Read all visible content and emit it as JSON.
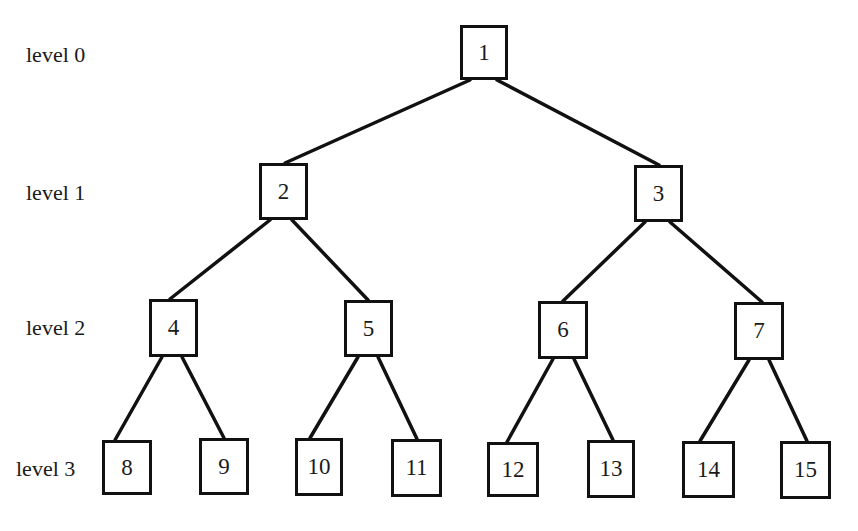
{
  "diagram": {
    "type": "complete binary tree",
    "levels": [
      {
        "label": "level 0",
        "x": 26,
        "y": 44
      },
      {
        "label": "level 1",
        "x": 26,
        "y": 182
      },
      {
        "label": "level 2",
        "x": 26,
        "y": 317
      },
      {
        "label": "level 3",
        "x": 16,
        "y": 458
      }
    ],
    "nodes": [
      {
        "id": "1",
        "label": "1",
        "x": 460,
        "y": 25,
        "w": 48,
        "h": 55
      },
      {
        "id": "2",
        "label": "2",
        "x": 259,
        "y": 163,
        "w": 49,
        "h": 57
      },
      {
        "id": "3",
        "label": "3",
        "x": 634,
        "y": 165,
        "w": 49,
        "h": 57
      },
      {
        "id": "4",
        "label": "4",
        "x": 149,
        "y": 299,
        "w": 49,
        "h": 58
      },
      {
        "id": "5",
        "label": "5",
        "x": 344,
        "y": 300,
        "w": 49,
        "h": 57
      },
      {
        "id": "6",
        "label": "6",
        "x": 538,
        "y": 301,
        "w": 50,
        "h": 58
      },
      {
        "id": "7",
        "label": "7",
        "x": 734,
        "y": 302,
        "w": 50,
        "h": 58
      },
      {
        "id": "8",
        "label": "8",
        "x": 102,
        "y": 440,
        "w": 50,
        "h": 55
      },
      {
        "id": "9",
        "label": "9",
        "x": 199,
        "y": 438,
        "w": 50,
        "h": 57
      },
      {
        "id": "10",
        "label": "10",
        "x": 295,
        "y": 438,
        "w": 48,
        "h": 58
      },
      {
        "id": "11",
        "label": "11",
        "x": 391,
        "y": 439,
        "w": 51,
        "h": 58
      },
      {
        "id": "12",
        "label": "12",
        "x": 487,
        "y": 442,
        "w": 52,
        "h": 55
      },
      {
        "id": "13",
        "label": "13",
        "x": 587,
        "y": 440,
        "w": 48,
        "h": 58
      },
      {
        "id": "14",
        "label": "14",
        "x": 682,
        "y": 441,
        "w": 53,
        "h": 57
      },
      {
        "id": "15",
        "label": "15",
        "x": 780,
        "y": 441,
        "w": 51,
        "h": 58
      }
    ],
    "edges": [
      {
        "from": "1",
        "to": "2",
        "x1": 470,
        "y1": 80,
        "x2": 285,
        "y2": 163
      },
      {
        "from": "1",
        "to": "3",
        "x1": 497,
        "y1": 80,
        "x2": 659,
        "y2": 165
      },
      {
        "from": "2",
        "to": "4",
        "x1": 270,
        "y1": 220,
        "x2": 170,
        "y2": 299
      },
      {
        "from": "2",
        "to": "5",
        "x1": 292,
        "y1": 220,
        "x2": 368,
        "y2": 300
      },
      {
        "from": "3",
        "to": "6",
        "x1": 645,
        "y1": 222,
        "x2": 563,
        "y2": 301
      },
      {
        "from": "3",
        "to": "7",
        "x1": 670,
        "y1": 222,
        "x2": 762,
        "y2": 302
      },
      {
        "from": "4",
        "to": "8",
        "x1": 162,
        "y1": 357,
        "x2": 115,
        "y2": 440
      },
      {
        "from": "4",
        "to": "9",
        "x1": 182,
        "y1": 357,
        "x2": 224,
        "y2": 438
      },
      {
        "from": "5",
        "to": "10",
        "x1": 358,
        "y1": 357,
        "x2": 310,
        "y2": 438
      },
      {
        "from": "5",
        "to": "11",
        "x1": 378,
        "y1": 357,
        "x2": 417,
        "y2": 439
      },
      {
        "from": "6",
        "to": "12",
        "x1": 553,
        "y1": 359,
        "x2": 507,
        "y2": 442
      },
      {
        "from": "6",
        "to": "13",
        "x1": 574,
        "y1": 359,
        "x2": 613,
        "y2": 440
      },
      {
        "from": "7",
        "to": "14",
        "x1": 749,
        "y1": 360,
        "x2": 700,
        "y2": 441
      },
      {
        "from": "7",
        "to": "15",
        "x1": 769,
        "y1": 360,
        "x2": 807,
        "y2": 441
      }
    ]
  }
}
